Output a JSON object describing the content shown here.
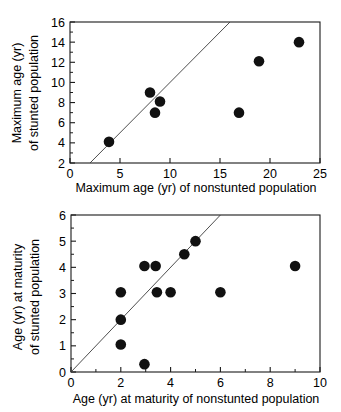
{
  "figure": {
    "title": "",
    "panels": [
      "maximum-age",
      "age-at-maturity"
    ]
  },
  "chart_data": [
    {
      "type": "scatter",
      "id": "maximum-age",
      "title": "",
      "xlabel": "Maximum age (yr) of nonstunted population",
      "ylabel": "Maximum age (yr) of stunted population",
      "ylabel_line1": "Maximum age (yr)",
      "ylabel_line2": "of stunted population",
      "xlim": [
        0,
        25
      ],
      "ylim": [
        2,
        16
      ],
      "xticks": [
        0,
        5,
        10,
        15,
        20,
        25
      ],
      "xticklabels": [
        "0",
        "5",
        "10",
        "15",
        "20",
        "25"
      ],
      "yticks": [
        2,
        4,
        6,
        8,
        10,
        12,
        14,
        16
      ],
      "yticklabels": [
        "2",
        "4",
        "6",
        "8",
        "10",
        "12",
        "14",
        "16"
      ],
      "y_minor_ticks": [
        3,
        5,
        7,
        9,
        11,
        13,
        15
      ],
      "grid": false,
      "legend": "none",
      "marker": "filled-circle",
      "marker_color": "#111111",
      "reference_line": {
        "label": "1:1 identity line",
        "type": "y=x",
        "x_from": 2,
        "x_to": 16,
        "y_from": 2,
        "y_to": 16,
        "color": "#3a3a3a"
      },
      "points": [
        {
          "x": 3.9,
          "y": 4.1
        },
        {
          "x": 8.0,
          "y": 9.0
        },
        {
          "x": 9.0,
          "y": 8.1
        },
        {
          "x": 8.5,
          "y": 7.0
        },
        {
          "x": 16.9,
          "y": 7.0
        },
        {
          "x": 18.9,
          "y": 12.1
        },
        {
          "x": 22.9,
          "y": 14.0
        }
      ]
    },
    {
      "type": "scatter",
      "id": "age-at-maturity",
      "title": "",
      "xlabel": "Age (yr) at maturity of nonstunted population",
      "ylabel": "Age (yr) at maturity of stunted population",
      "ylabel_line1": "Age (yr) at maturity",
      "ylabel_line2": "of stunted population",
      "xlim": [
        0,
        10
      ],
      "ylim": [
        0,
        6
      ],
      "xticks": [
        0,
        2,
        4,
        6,
        8,
        10
      ],
      "xticklabels": [
        "0",
        "2",
        "4",
        "6",
        "8",
        "10"
      ],
      "yticks": [
        0,
        1,
        2,
        3,
        4,
        5,
        6
      ],
      "yticklabels": [
        "0",
        "1",
        "2",
        "3",
        "4",
        "5",
        "6"
      ],
      "x_minor_ticks": [
        1,
        3,
        5,
        7,
        9
      ],
      "y_minor_ticks": [
        0.5,
        1.5,
        2.5,
        3.5,
        4.5,
        5.5
      ],
      "grid": false,
      "legend": "none",
      "marker": "filled-circle",
      "marker_color": "#111111",
      "reference_line": {
        "label": "1:1 identity line",
        "type": "y=x",
        "x_from": 0,
        "x_to": 6,
        "y_from": 0,
        "y_to": 6,
        "color": "#3a3a3a"
      },
      "points": [
        {
          "x": 2.0,
          "y": 3.05
        },
        {
          "x": 2.0,
          "y": 2.0
        },
        {
          "x": 2.0,
          "y": 1.05
        },
        {
          "x": 2.95,
          "y": 0.3
        },
        {
          "x": 2.95,
          "y": 4.05
        },
        {
          "x": 3.4,
          "y": 4.05
        },
        {
          "x": 3.45,
          "y": 3.05
        },
        {
          "x": 4.0,
          "y": 3.05
        },
        {
          "x": 4.55,
          "y": 4.5
        },
        {
          "x": 5.0,
          "y": 5.0
        },
        {
          "x": 6.0,
          "y": 3.05
        },
        {
          "x": 9.0,
          "y": 4.05
        }
      ]
    }
  ]
}
